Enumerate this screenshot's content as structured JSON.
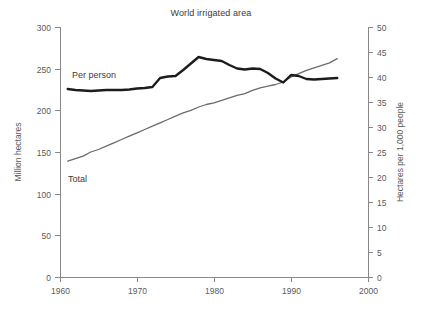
{
  "chart_data": {
    "type": "line",
    "title": "World irrigated area",
    "xlabel": "",
    "ylabel": "Million hectares",
    "y2label": "Hectares per 1,000 people",
    "xlim": [
      1960,
      2000
    ],
    "ylim": [
      0,
      300
    ],
    "y2lim": [
      0,
      50
    ],
    "xticks": [
      1960,
      1970,
      1980,
      1990,
      2000
    ],
    "yticks": [
      0,
      50,
      100,
      150,
      200,
      250,
      300
    ],
    "y2ticks": [
      0,
      5,
      10,
      15,
      20,
      25,
      30,
      35,
      40,
      45,
      50
    ],
    "grid": false,
    "legend_position": "inline-annotation",
    "annotations": [
      {
        "text": "Per person",
        "x": 1964.0,
        "y_axis": "right",
        "y": 41.5
      },
      {
        "text": "Total",
        "x": 1963.5,
        "y_axis": "left",
        "y": 118
      }
    ],
    "series": [
      {
        "name": "Total",
        "axis": "left",
        "unit": "Million hectares",
        "color": "#6b6b6b",
        "stroke_width": 1.3,
        "x": [
          1961,
          1962,
          1963,
          1964,
          1965,
          1966,
          1967,
          1968,
          1969,
          1970,
          1971,
          1972,
          1973,
          1974,
          1975,
          1976,
          1977,
          1978,
          1979,
          1980,
          1981,
          1982,
          1983,
          1984,
          1985,
          1986,
          1987,
          1988,
          1989,
          1990,
          1991,
          1992,
          1993,
          1994,
          1995,
          1996
        ],
        "values": [
          139,
          142,
          145,
          150,
          153,
          157,
          161,
          165,
          169,
          173,
          177,
          181,
          185,
          189,
          193,
          197,
          200,
          204,
          207,
          209,
          212,
          215,
          218,
          220,
          224,
          227,
          229,
          231,
          234,
          240,
          244,
          248,
          251,
          254,
          257,
          262
        ]
      },
      {
        "name": "Per person",
        "axis": "right",
        "unit": "Hectares per 1,000 people",
        "color": "#1c1c1c",
        "stroke_width": 2.4,
        "x": [
          1961,
          1962,
          1963,
          1964,
          1965,
          1966,
          1967,
          1968,
          1969,
          1970,
          1971,
          1972,
          1973,
          1974,
          1975,
          1976,
          1977,
          1978,
          1979,
          1980,
          1981,
          1982,
          1983,
          1984,
          1985,
          1986,
          1987,
          1988,
          1989,
          1990,
          1991,
          1992,
          1993,
          1994,
          1995,
          1996
        ],
        "values": [
          37.6,
          37.4,
          37.3,
          37.2,
          37.3,
          37.4,
          37.4,
          37.4,
          37.5,
          37.7,
          37.8,
          38.0,
          39.8,
          40.1,
          40.2,
          41.4,
          42.7,
          44.0,
          43.6,
          43.4,
          43.2,
          42.4,
          41.7,
          41.5,
          41.7,
          41.6,
          40.8,
          39.7,
          38.9,
          40.4,
          40.2,
          39.6,
          39.5,
          39.6,
          39.7,
          39.8
        ]
      }
    ]
  },
  "axes": {
    "left_title": "Million hectares",
    "right_title": "Hectares per 1,000 people",
    "left_ticks": [
      "300",
      "250",
      "200",
      "150",
      "100",
      "50",
      "0"
    ],
    "right_ticks": [
      "50",
      "45",
      "40",
      "35",
      "30",
      "25",
      "20",
      "15",
      "10",
      "5",
      "0"
    ],
    "x_ticks": [
      "1960",
      "1970",
      "1980",
      "1990",
      "2000"
    ]
  },
  "labels": {
    "per_person": "Per person",
    "total": "Total"
  },
  "colors": {
    "per_person_line": "#1c1c1c",
    "total_line": "#6b6b6b",
    "axis": "#888888",
    "text": "#5a5a5a",
    "title_text": "#3a3a3a",
    "background": "#ffffff"
  }
}
